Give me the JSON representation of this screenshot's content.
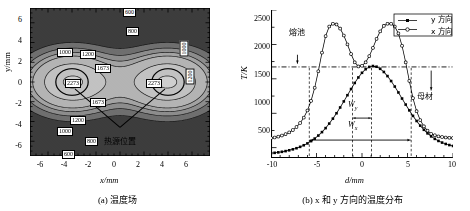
{
  "figure": {
    "panel_a": {
      "caption": "(a) 温度场",
      "xlabel": "x/mm",
      "ylabel": "y/mm",
      "xticks": [
        "-6",
        "-4",
        "-2",
        "0",
        "2",
        "4",
        "6"
      ],
      "yticks": [
        "6",
        "4",
        "2",
        "0",
        "-2",
        "-4",
        "-6"
      ],
      "annotation": "热源位置",
      "contour_labels": [
        "600",
        "800",
        "1000",
        "1200",
        "1673",
        "2273",
        "1673",
        "1200",
        "1000",
        "800",
        "600",
        "1000",
        "1200"
      ]
    },
    "panel_b": {
      "caption": "(b) x 和 y 方向的温度分布",
      "xlabel": "d/mm",
      "ylabel": "T/K",
      "xticks": [
        "-10",
        "-5",
        "0",
        "5",
        "10"
      ],
      "yticks": [
        "500",
        "1000",
        "1500",
        "2000",
        "2500"
      ],
      "legend": [
        {
          "label": "y 方向",
          "marker": "filled-square"
        },
        {
          "label": "x 方向",
          "marker": "open-circle"
        }
      ],
      "annotations": {
        "melt_pool": "熔池",
        "base_metal": "母材",
        "width_y": "W",
        "width_y_sub": "y",
        "width_x": "W",
        "width_x_sub": "x"
      },
      "liquidus_line": 1673
    }
  },
  "chart_data": [
    {
      "type": "heatmap",
      "title": "(a) 温度场",
      "xlabel": "x/mm",
      "ylabel": "y/mm",
      "xlim": [
        -7.5,
        7.5
      ],
      "ylim": [
        -7.5,
        7.5
      ],
      "unit": "K",
      "contour_levels": [
        600,
        800,
        1000,
        1200,
        1673,
        2273
      ],
      "heat_source_positions": [
        [
          -4.0,
          0.0
        ],
        [
          4.0,
          0.0
        ]
      ],
      "heat_source_radius_mm": 1.35,
      "peak_temperature": 2273,
      "liquidus": 1673,
      "grid": false,
      "legend": "none"
    },
    {
      "type": "line",
      "title": "(b) x 和 y 方向的温度分布",
      "xlabel": "d/mm",
      "ylabel": "T/K",
      "xlim": [
        -10,
        10
      ],
      "ylim": [
        350,
        2500
      ],
      "grid": false,
      "legend": "upper right",
      "hline": 1673,
      "series": [
        {
          "name": "y 方向",
          "marker": "filled-square",
          "x": [
            -10,
            -9.6,
            -9.2,
            -8.8,
            -8.4,
            -8,
            -7.6,
            -7.2,
            -6.8,
            -6.4,
            -6,
            -5.6,
            -5.2,
            -4.8,
            -4.4,
            -4,
            -3.6,
            -3.2,
            -2.8,
            -2.4,
            -2,
            -1.6,
            -1.2,
            -0.8,
            -0.4,
            0,
            0.4,
            0.8,
            1.2,
            1.6,
            2,
            2.4,
            2.8,
            3.2,
            3.6,
            4,
            4.4,
            4.8,
            5.2,
            5.6,
            6,
            6.4,
            6.8,
            7.2,
            7.6,
            8,
            8.4,
            8.8,
            9.2,
            9.6,
            10
          ],
          "y": [
            420,
            425,
            432,
            440,
            450,
            462,
            476,
            492,
            512,
            535,
            562,
            595,
            632,
            676,
            726,
            784,
            850,
            922,
            1000,
            1084,
            1172,
            1262,
            1352,
            1440,
            1520,
            1588,
            1640,
            1673,
            1686,
            1676,
            1646,
            1600,
            1540,
            1468,
            1388,
            1302,
            1214,
            1126,
            1042,
            962,
            888,
            820,
            760,
            708,
            664,
            628,
            598,
            574,
            554,
            538,
            525
          ]
        },
        {
          "name": "x 方向",
          "marker": "open-circle",
          "x": [
            -10,
            -9.6,
            -9.2,
            -8.8,
            -8.4,
            -8,
            -7.6,
            -7.2,
            -6.8,
            -6.4,
            -6,
            -5.6,
            -5.2,
            -4.8,
            -4.4,
            -4,
            -3.6,
            -3.2,
            -2.8,
            -2.4,
            -2,
            -1.6,
            -1.2,
            -0.8,
            -0.4,
            0,
            0.4,
            0.8,
            1.2,
            1.6,
            2,
            2.4,
            2.8,
            3.2,
            3.6,
            4,
            4.4,
            4.8,
            5.2,
            5.6,
            6,
            6.4,
            6.8,
            7.2,
            7.6,
            8,
            8.4,
            8.8,
            9.2,
            9.6,
            10
          ],
          "y": [
            640,
            648,
            660,
            676,
            696,
            722,
            756,
            800,
            858,
            936,
            1040,
            1180,
            1370,
            1610,
            1880,
            2120,
            2260,
            2300,
            2290,
            2230,
            2130,
            2000,
            1860,
            1740,
            1680,
            1690,
            1740,
            1830,
            1950,
            2080,
            2190,
            2270,
            2300,
            2300,
            2260,
            2160,
            1980,
            1740,
            1470,
            1220,
            1030,
            900,
            810,
            748,
            700,
            680,
            664,
            655,
            648,
            644,
            640
          ]
        }
      ]
    }
  ]
}
